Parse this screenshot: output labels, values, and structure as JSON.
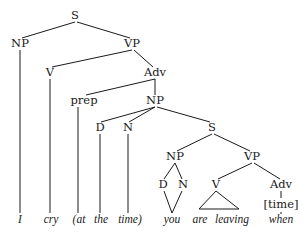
{
  "diagram": {
    "type": "syntax-tree",
    "colors": {
      "ink": "#1a1a1a",
      "background": "#ffffff"
    },
    "nodes": [
      {
        "id": "s1",
        "label": "S",
        "x": 75,
        "y": 16
      },
      {
        "id": "np1",
        "label": "NP",
        "x": 20,
        "y": 44
      },
      {
        "id": "vp1",
        "label": "VP",
        "x": 132,
        "y": 44
      },
      {
        "id": "v1",
        "label": "V",
        "x": 50,
        "y": 73
      },
      {
        "id": "adv1",
        "label": "Adv",
        "x": 155,
        "y": 73
      },
      {
        "id": "prep1",
        "label": "prep",
        "x": 84,
        "y": 101
      },
      {
        "id": "np2",
        "label": "NP",
        "x": 155,
        "y": 101
      },
      {
        "id": "d1",
        "label": "D",
        "x": 100,
        "y": 128
      },
      {
        "id": "n1",
        "label": "N",
        "x": 128,
        "y": 128
      },
      {
        "id": "s2",
        "label": "S",
        "x": 212,
        "y": 128
      },
      {
        "id": "np3",
        "label": "NP",
        "x": 175,
        "y": 157
      },
      {
        "id": "vp2",
        "label": "VP",
        "x": 252,
        "y": 157
      },
      {
        "id": "d2",
        "label": "D",
        "x": 163,
        "y": 185
      },
      {
        "id": "n2",
        "label": "N",
        "x": 183,
        "y": 185
      },
      {
        "id": "v2",
        "label": "V",
        "x": 216,
        "y": 185
      },
      {
        "id": "adv2",
        "label": "Adv",
        "x": 281,
        "y": 185
      },
      {
        "id": "time-feature",
        "label": "[time]",
        "x": 281,
        "y": 205
      }
    ],
    "words": [
      {
        "id": "w-i",
        "text": "I",
        "x": 20,
        "y": 220
      },
      {
        "id": "w-cry",
        "text": "cry",
        "x": 51,
        "y": 220
      },
      {
        "id": "w-at",
        "text": "(at",
        "x": 79,
        "y": 220
      },
      {
        "id": "w-the",
        "text": "the",
        "x": 101,
        "y": 220
      },
      {
        "id": "w-time",
        "text": "time)",
        "x": 130,
        "y": 220
      },
      {
        "id": "w-you",
        "text": "you",
        "x": 172,
        "y": 220
      },
      {
        "id": "w-are",
        "text": "are",
        "x": 200,
        "y": 220
      },
      {
        "id": "w-leaving",
        "text": "leaving",
        "x": 232,
        "y": 220
      },
      {
        "id": "w-when",
        "text": "when",
        "x": 281,
        "y": 220
      }
    ],
    "edges": [
      [
        75,
        22,
        22,
        38
      ],
      [
        77,
        22,
        130,
        38
      ],
      [
        132,
        50,
        52,
        67
      ],
      [
        134,
        50,
        153,
        67
      ],
      [
        155,
        79,
        86,
        95
      ],
      [
        155,
        79,
        155,
        95
      ],
      [
        155,
        107,
        101,
        122
      ],
      [
        155,
        107,
        129,
        122
      ],
      [
        157,
        107,
        210,
        122
      ],
      [
        212,
        134,
        177,
        151
      ],
      [
        214,
        134,
        250,
        151
      ],
      [
        175,
        163,
        164,
        179
      ],
      [
        175,
        163,
        182,
        179
      ],
      [
        164,
        191,
        172,
        213
      ],
      [
        182,
        191,
        172,
        213
      ],
      [
        252,
        163,
        218,
        179
      ],
      [
        254,
        163,
        280,
        179
      ],
      [
        281,
        191,
        281,
        198
      ],
      [
        281,
        212,
        281,
        214
      ],
      [
        20,
        50,
        20,
        213
      ],
      [
        50,
        79,
        50,
        213
      ],
      [
        78,
        107,
        78,
        213
      ],
      [
        100,
        134,
        100,
        213
      ],
      [
        128,
        134,
        128,
        213
      ]
    ],
    "triangles": [
      {
        "apex": [
          216,
          191
        ],
        "left": [
          199,
          209
        ],
        "right": [
          239,
          209
        ]
      }
    ]
  }
}
